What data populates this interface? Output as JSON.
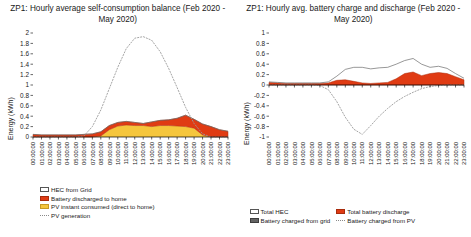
{
  "left": {
    "title": "ZP1: Hourly average self-consumption balance (Feb 2020 - May 2020)",
    "ylabel": "Energy (kWh)",
    "legend": [
      {
        "key": "hec-from-grid",
        "label": "HEC from Grid",
        "swatch": "white"
      },
      {
        "key": "battery-discharged-to-home",
        "label": "Battery discharged to home",
        "swatch": "red"
      },
      {
        "key": "pv-instant-consumed",
        "label": "PV instant consumed (direct to home)",
        "swatch": "yellow"
      },
      {
        "key": "pv-generation",
        "label": "PV generation",
        "swatch": "dotted"
      }
    ]
  },
  "right": {
    "title": "ZP1: Hourly avg. battery charge and discharge (Feb 2020 - May 2020)",
    "ylabel": "Energy (kWh)",
    "legend": [
      {
        "key": "total-hec",
        "label": "Total HEC",
        "swatch": "white"
      },
      {
        "key": "total-battery-discharge",
        "label": "Total battery discharge",
        "swatch": "red"
      },
      {
        "key": "battery-charged-from-grid",
        "label": "Battery charged from grid",
        "swatch": "gray"
      },
      {
        "key": "battery-charged-from-pv",
        "label": "Battery charged from PV",
        "swatch": "dotted"
      }
    ]
  },
  "chart_data": [
    {
      "type": "area",
      "id": "self-consumption-balance",
      "title": "ZP1: Hourly average self-consumption balance (Feb 2020 - May 2020)",
      "xlabel": "",
      "ylabel": "Energy (kWh)",
      "ylim": [
        0,
        2
      ],
      "yticks": [
        0,
        0.2,
        0.4,
        0.6,
        0.8,
        1,
        1.2,
        1.4,
        1.6,
        1.8,
        2
      ],
      "ytick_labels": [
        "0",
        "0.2",
        "0.4",
        "0.6",
        "0.8",
        "1",
        "1.2",
        "1.4",
        "1.6",
        "1.8",
        "2"
      ],
      "grid": false,
      "legend_position": "bottom-left",
      "categories": [
        "00:00:00",
        "01:00:00",
        "02:00:00",
        "03:00:00",
        "04:00:00",
        "05:00:00",
        "06:00:00",
        "07:00:00",
        "08:00:00",
        "09:00:00",
        "10:00:00",
        "11:00:00",
        "12:00:00",
        "13:00:00",
        "14:00:00",
        "15:00:00",
        "16:00:00",
        "17:00:00",
        "18:00:00",
        "19:00:00",
        "20:00:00",
        "21:00:00",
        "22:00:00",
        "23:00:00"
      ],
      "stacked": true,
      "series": [
        {
          "name": "PV instant consumed (direct to home)",
          "color": "#f5c63c",
          "kind": "area",
          "values": [
            0,
            0,
            0,
            0,
            0,
            0,
            0,
            0,
            0.02,
            0.14,
            0.21,
            0.23,
            0.22,
            0.22,
            0.2,
            0.22,
            0.22,
            0.21,
            0.2,
            0.17,
            0.04,
            0,
            0,
            0
          ]
        },
        {
          "name": "Battery discharged to home",
          "color": "#e03b13",
          "kind": "area",
          "values": [
            0.05,
            0.04,
            0.04,
            0.04,
            0.04,
            0.04,
            0.05,
            0.06,
            0.08,
            0.08,
            0.07,
            0.07,
            0.06,
            0.04,
            0.09,
            0.1,
            0.11,
            0.15,
            0.22,
            0.17,
            0.21,
            0.2,
            0.14,
            0.11
          ]
        },
        {
          "name": "HEC from Grid",
          "color": "#ffffff",
          "kind": "line",
          "values": [
            0.05,
            0.04,
            0.04,
            0.04,
            0.04,
            0.04,
            0.05,
            0.06,
            0.1,
            0.22,
            0.28,
            0.3,
            0.28,
            0.26,
            0.29,
            0.32,
            0.33,
            0.36,
            0.42,
            0.34,
            0.25,
            0.2,
            0.14,
            0.11
          ]
        },
        {
          "name": "PV generation",
          "color": "#8a8a8a",
          "kind": "dotted-line",
          "values": [
            0,
            0,
            0,
            0,
            0,
            0,
            0.02,
            0.2,
            0.52,
            0.93,
            1.34,
            1.7,
            1.9,
            1.93,
            1.86,
            1.64,
            1.32,
            0.95,
            0.57,
            0.26,
            0.06,
            0,
            0,
            0
          ]
        }
      ]
    },
    {
      "type": "area",
      "id": "battery-charge-discharge",
      "title": "ZP1: Hourly avg. battery charge and discharge (Feb 2020 - May 2020)",
      "xlabel": "",
      "ylabel": "Energy (kWh)",
      "ylim": [
        -1,
        1
      ],
      "yticks": [
        -1,
        -0.8,
        -0.6,
        -0.4,
        -0.2,
        0,
        0.2,
        0.4,
        0.6,
        0.8,
        1
      ],
      "ytick_labels": [
        "-1",
        "-0.8",
        "-0.6",
        "-0.4",
        "-0.2",
        "0",
        "0.2",
        "0.4",
        "0.6",
        "0.8",
        "1"
      ],
      "grid": false,
      "legend_position": "bottom",
      "categories": [
        "00:00:00",
        "01:00:00",
        "02:00:00",
        "03:00:00",
        "04:00:00",
        "05:00:00",
        "06:00:00",
        "07:00:00",
        "08:00:00",
        "09:00:00",
        "10:00:00",
        "11:00:00",
        "12:00:00",
        "13:00:00",
        "14:00:00",
        "15:00:00",
        "16:00:00",
        "17:00:00",
        "18:00:00",
        "19:00:00",
        "20:00:00",
        "21:00:00",
        "22:00:00",
        "23:00:00"
      ],
      "stacked": false,
      "series": [
        {
          "name": "Total battery discharge",
          "color": "#e03b13",
          "kind": "area",
          "values": [
            0.05,
            0.04,
            0.03,
            0.03,
            0.03,
            0.03,
            0.03,
            0.04,
            0.09,
            0.1,
            0.07,
            0.04,
            0.03,
            0.04,
            0.05,
            0.12,
            0.22,
            0.25,
            0.18,
            0.22,
            0.24,
            0.22,
            0.16,
            0.1
          ]
        },
        {
          "name": "Total HEC",
          "color": "#ffffff",
          "kind": "line",
          "values": [
            0.06,
            0.05,
            0.04,
            0.04,
            0.04,
            0.04,
            0.04,
            0.06,
            0.17,
            0.3,
            0.34,
            0.34,
            0.31,
            0.33,
            0.34,
            0.4,
            0.47,
            0.51,
            0.4,
            0.34,
            0.36,
            0.32,
            0.22,
            0.13
          ]
        },
        {
          "name": "Battery charged from grid",
          "color": "#636363",
          "kind": "area",
          "values": [
            0,
            0,
            0,
            0,
            0,
            0,
            0,
            0,
            0,
            0,
            0,
            0,
            0,
            0,
            0,
            0,
            0,
            0,
            0,
            0,
            0,
            0,
            0,
            0
          ]
        },
        {
          "name": "Battery charged from PV",
          "color": "#8a8a8a",
          "kind": "dotted-line",
          "values": [
            0,
            0,
            0,
            0,
            0,
            0,
            -0.01,
            -0.09,
            -0.32,
            -0.62,
            -0.85,
            -0.95,
            -0.78,
            -0.6,
            -0.45,
            -0.32,
            -0.22,
            -0.14,
            -0.07,
            -0.03,
            -0.01,
            0,
            0,
            0
          ]
        }
      ]
    }
  ]
}
